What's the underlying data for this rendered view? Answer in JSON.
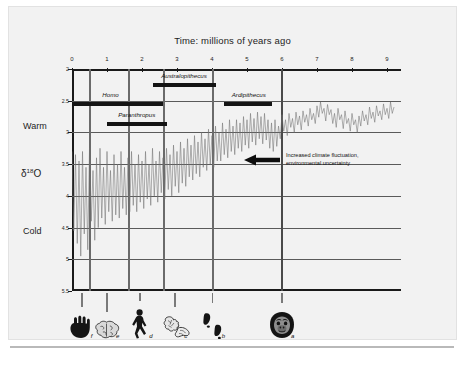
{
  "title": "Time:  millions of years ago",
  "axes": {
    "y_label": "δ18O",
    "y_label_base": "δ",
    "y_label_sup": "18",
    "y_label_tail": "O",
    "warm_label": "Warm",
    "cold_label": "Cold",
    "x_ticks": [
      "0",
      "1",
      "2",
      "3",
      "4",
      "5",
      "6",
      "7",
      "8",
      "9"
    ],
    "y_ticks": [
      "2",
      "2.5",
      "3",
      "3.5",
      "4",
      "4.5",
      "5",
      "5.5"
    ]
  },
  "annotation": {
    "line1": "Increased climate fluctuation,",
    "line2": "environmental uncertainty",
    "arrow_name": "left-arrow-icon"
  },
  "taxa": [
    {
      "name": "Homo",
      "start": 0.0,
      "end": 2.6,
      "label_x": 1.1,
      "row": 0
    },
    {
      "name": "Paranthropus",
      "start": 1.0,
      "end": 2.72,
      "label_x": 1.85,
      "row": 1
    },
    {
      "name": "Australopithecus",
      "start": 2.32,
      "end": 4.12,
      "label_x": 3.2,
      "row": 2
    },
    {
      "name": "Ardipithecus",
      "start": 4.35,
      "end": 5.72,
      "label_x": 5.05,
      "row": 3
    }
  ],
  "event_markers": [
    0.5,
    1.62,
    2.62,
    4.02,
    6.0
  ],
  "icons": [
    {
      "letter": "f",
      "x": 0.28,
      "name": "hand-icon"
    },
    {
      "letter": "e",
      "x": 1.0,
      "name": "brain-icon"
    },
    {
      "letter": "d",
      "x": 1.95,
      "name": "walking-hominin-icon"
    },
    {
      "letter": "c",
      "x": 2.95,
      "name": "stone-tools-icon"
    },
    {
      "letter": "b",
      "x": 4.02,
      "name": "footprints-icon"
    },
    {
      "letter": "a",
      "x": 6.0,
      "name": "ape-face-icon"
    }
  ],
  "chart_data": {
    "type": "line",
    "title": "Time:  millions of years ago",
    "xlabel": "Time: millions of years ago",
    "ylabel": "δ18O",
    "xlim": [
      0,
      9.4
    ],
    "ylim": [
      5.5,
      2.0
    ],
    "y_axis_inverted": true,
    "grid": true,
    "legend": "none",
    "series_name": "benthic δ18O stack",
    "note": "Higher δ18O (down) = colder; lower δ18O (up) = warmer. Variability increases toward present (left).",
    "x": [
      0.0,
      0.05,
      0.1,
      0.15,
      0.2,
      0.25,
      0.3,
      0.35,
      0.4,
      0.45,
      0.5,
      0.55,
      0.6,
      0.65,
      0.7,
      0.75,
      0.8,
      0.85,
      0.9,
      0.95,
      1.0,
      1.05,
      1.1,
      1.15,
      1.2,
      1.25,
      1.3,
      1.35,
      1.4,
      1.45,
      1.5,
      1.55,
      1.6,
      1.65,
      1.7,
      1.75,
      1.8,
      1.85,
      1.9,
      1.95,
      2.0,
      2.05,
      2.1,
      2.15,
      2.2,
      2.25,
      2.3,
      2.35,
      2.4,
      2.45,
      2.5,
      2.55,
      2.6,
      2.65,
      2.7,
      2.75,
      2.8,
      2.85,
      2.9,
      2.95,
      3.0,
      3.05,
      3.1,
      3.15,
      3.2,
      3.25,
      3.3,
      3.35,
      3.4,
      3.45,
      3.5,
      3.55,
      3.6,
      3.65,
      3.7,
      3.75,
      3.8,
      3.85,
      3.9,
      3.95,
      4.0,
      4.05,
      4.1,
      4.15,
      4.2,
      4.25,
      4.3,
      4.35,
      4.4,
      4.45,
      4.5,
      4.55,
      4.6,
      4.65,
      4.7,
      4.75,
      4.8,
      4.85,
      4.9,
      4.95,
      5.0,
      5.05,
      5.1,
      5.15,
      5.2,
      5.25,
      5.3,
      5.35,
      5.4,
      5.45,
      5.5,
      5.55,
      5.6,
      5.65,
      5.7,
      5.75,
      5.8,
      5.85,
      5.9,
      5.95,
      6.0,
      6.05,
      6.1,
      6.15,
      6.2,
      6.25,
      6.3,
      6.35,
      6.4,
      6.45,
      6.5,
      6.55,
      6.6,
      6.65,
      6.7,
      6.75,
      6.8,
      6.85,
      6.9,
      6.95,
      7.0,
      7.05,
      7.1,
      7.15,
      7.2,
      7.25,
      7.3,
      7.35,
      7.4,
      7.45,
      7.5,
      7.55,
      7.6,
      7.65,
      7.7,
      7.75,
      7.8,
      7.85,
      7.9,
      7.95,
      8.0,
      8.05,
      8.1,
      8.15,
      8.2,
      8.25,
      8.3,
      8.35,
      8.4,
      8.45,
      8.5,
      8.55,
      8.6,
      8.65,
      8.7,
      8.75,
      8.8,
      8.85,
      8.9,
      8.95,
      9.0,
      9.05,
      9.1,
      9.15,
      9.2,
      9.25,
      9.3,
      9.35
    ],
    "y": [
      3.3,
      4.55,
      3.35,
      4.75,
      3.45,
      4.95,
      3.3,
      4.6,
      3.55,
      4.85,
      3.25,
      4.4,
      3.6,
      4.7,
      3.4,
      4.5,
      3.25,
      4.35,
      3.55,
      4.45,
      3.3,
      4.25,
      3.6,
      4.4,
      3.35,
      4.3,
      3.5,
      4.35,
      3.3,
      4.2,
      3.55,
      4.3,
      3.4,
      4.25,
      3.3,
      4.15,
      3.5,
      4.25,
      3.35,
      4.1,
      3.45,
      4.2,
      3.3,
      4.05,
      3.5,
      4.15,
      3.25,
      4.0,
      3.45,
      4.1,
      3.3,
      3.95,
      3.4,
      4.05,
      3.25,
      3.9,
      3.35,
      4.0,
      3.2,
      3.85,
      3.3,
      3.95,
      3.15,
      3.8,
      3.25,
      3.85,
      3.1,
      3.7,
      3.2,
      3.75,
      3.05,
      3.65,
      3.15,
      3.7,
      3.0,
      3.55,
      3.1,
      3.6,
      2.95,
      3.5,
      3.05,
      3.55,
      2.9,
      3.45,
      3.0,
      3.45,
      2.85,
      3.35,
      2.95,
      3.4,
      2.8,
      3.3,
      2.9,
      3.35,
      2.8,
      3.25,
      2.85,
      3.3,
      2.75,
      3.2,
      2.8,
      3.25,
      2.7,
      3.15,
      2.78,
      3.2,
      2.68,
      3.1,
      2.75,
      3.18,
      2.7,
      3.12,
      2.8,
      3.25,
      2.85,
      3.3,
      2.8,
      3.22,
      2.9,
      3.1,
      2.72,
      2.98,
      2.8,
      3.05,
      2.7,
      2.92,
      2.78,
      3.0,
      2.68,
      2.88,
      2.74,
      2.96,
      2.66,
      2.84,
      2.72,
      2.9,
      2.62,
      2.8,
      2.7,
      2.86,
      2.58,
      2.76,
      2.52,
      2.7,
      2.62,
      2.82,
      2.56,
      2.72,
      2.64,
      2.86,
      2.7,
      2.92,
      2.62,
      2.8,
      2.72,
      2.94,
      2.66,
      2.86,
      2.78,
      2.98,
      2.7,
      2.88,
      2.8,
      3.0,
      2.74,
      2.9,
      2.66,
      2.82,
      2.72,
      2.88,
      2.6,
      2.78,
      2.68,
      2.84,
      2.58,
      2.74,
      2.66,
      2.8,
      2.55,
      2.72,
      2.62,
      2.78,
      2.52,
      2.7,
      2.6
    ]
  }
}
